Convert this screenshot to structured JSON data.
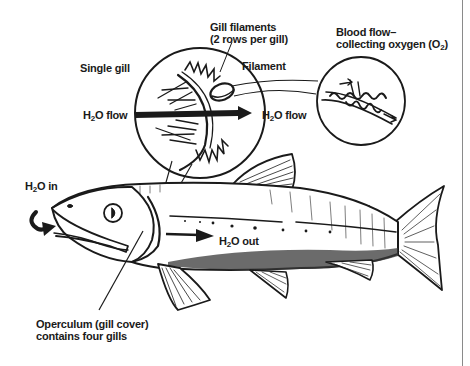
{
  "diagram": {
    "type": "labeled-illustration",
    "colors": {
      "ink": "#1a1a1a",
      "background": "#ffffff",
      "frame_line": "#8a8a8a"
    },
    "labels": {
      "gill_filaments_line1": "Gill filaments",
      "gill_filaments_line2": "(2 rows per gill)",
      "blood_flow_line1": "Blood flow–",
      "blood_flow_line2_prefix": "collecting oxygen (O",
      "blood_flow_line2_sub": "2",
      "blood_flow_line2_suffix": ")",
      "single_gill": "Single gill",
      "filament": "Filament",
      "h2o_flow_left_prefix": "H",
      "h2o_flow_left_sub": "2",
      "h2o_flow_left_suffix": "O flow",
      "h2o_flow_right_prefix": "H",
      "h2o_flow_right_sub": "2",
      "h2o_flow_right_suffix": "O flow",
      "h2o_in_prefix": "H",
      "h2o_in_sub": "2",
      "h2o_in_suffix": "O in",
      "h2o_out_prefix": "H",
      "h2o_out_sub": "2",
      "h2o_out_suffix": "O out",
      "operculum_line1": "Operculum (gill cover)",
      "operculum_line2": "contains four gills"
    },
    "nodes": [
      {
        "id": "single-gill-magnifier",
        "label": "Single gill"
      },
      {
        "id": "filament-magnifier",
        "label": "Blood flow–collecting oxygen (O2)"
      },
      {
        "id": "fish-body",
        "label": "Fish"
      },
      {
        "id": "operculum",
        "label": "Operculum (gill cover) contains four gills"
      }
    ],
    "flows": [
      {
        "from": "mouth",
        "to": "gills",
        "label": "H2O in"
      },
      {
        "from": "gills",
        "to": "out",
        "label": "H2O out"
      },
      {
        "from": "gill-left",
        "to": "gill-right",
        "label": "H2O flow"
      }
    ]
  }
}
